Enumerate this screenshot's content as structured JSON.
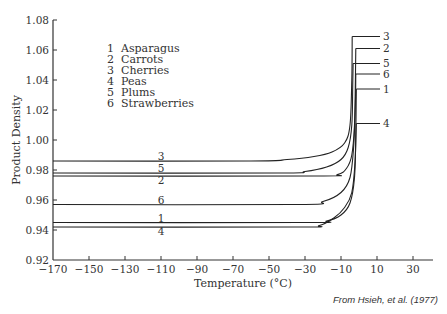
{
  "chart_data": {
    "type": "line",
    "title": "",
    "xlabel": "Temperature (°C)",
    "ylabel": "Product Density",
    "xlim": [
      -170,
      40
    ],
    "ylim": [
      0.92,
      1.08
    ],
    "x_ticks": [
      -170,
      -150,
      -130,
      -110,
      -90,
      -70,
      -50,
      -30,
      -10,
      10,
      30
    ],
    "y_ticks": [
      "0.92",
      "0.94",
      "0.96",
      "0.98",
      "1.00",
      "1.02",
      "1.04",
      "1.06",
      "1.08"
    ],
    "grid": false,
    "legend": {
      "position": "upper-left-inside",
      "entries": [
        {
          "num": "1",
          "label": "Asparagus"
        },
        {
          "num": "2",
          "label": "Carrots"
        },
        {
          "num": "3",
          "label": "Cherries"
        },
        {
          "num": "4",
          "label": "Peas"
        },
        {
          "num": "5",
          "label": "Plums"
        },
        {
          "num": "6",
          "label": "Strawberries"
        }
      ]
    },
    "series": [
      {
        "name": "Cherries",
        "num": "3",
        "x": [
          -170,
          -60,
          -40,
          -25,
          -15,
          -8,
          -5,
          -4,
          -3.8
        ],
        "y": [
          0.986,
          0.986,
          0.987,
          0.989,
          0.992,
          0.998,
          1.01,
          1.04,
          1.069
        ]
      },
      {
        "name": "Plums",
        "num": "5",
        "x": [
          -170,
          -45,
          -30,
          -18,
          -10,
          -6,
          -4,
          -3.5,
          -3.3
        ],
        "y": [
          0.978,
          0.978,
          0.979,
          0.982,
          0.987,
          0.995,
          1.01,
          1.035,
          1.051
        ]
      },
      {
        "name": "Carrots",
        "num": "2",
        "x": [
          -170,
          -25,
          -12,
          -7,
          -4,
          -2.5,
          -2,
          -1.8
        ],
        "y": [
          0.976,
          0.976,
          0.977,
          0.981,
          0.99,
          1.01,
          1.04,
          1.061
        ]
      },
      {
        "name": "Strawberries",
        "num": "6",
        "x": [
          -170,
          -35,
          -20,
          -10,
          -5,
          -3,
          -2,
          -1.8
        ],
        "y": [
          0.957,
          0.957,
          0.959,
          0.965,
          0.975,
          0.995,
          1.025,
          1.044
        ]
      },
      {
        "name": "Asparagus",
        "num": "1",
        "x": [
          -170,
          -30,
          -18,
          -10,
          -5,
          -2.5,
          -1.8,
          -1.5
        ],
        "y": [
          0.945,
          0.945,
          0.946,
          0.95,
          0.958,
          0.975,
          1.005,
          1.034
        ]
      },
      {
        "name": "Peas",
        "num": "4",
        "x": [
          -170,
          -35,
          -22,
          -14,
          -8,
          -4,
          -2.2,
          -1.5
        ],
        "y": [
          0.942,
          0.942,
          0.943,
          0.948,
          0.955,
          0.965,
          0.985,
          1.011
        ]
      }
    ],
    "curve_labels_left": [
      {
        "num": "3",
        "x": -110,
        "y": 0.989
      },
      {
        "num": "5",
        "x": -110,
        "y": 0.981
      },
      {
        "num": "2",
        "x": -110,
        "y": 0.973
      },
      {
        "num": "6",
        "x": -110,
        "y": 0.96
      },
      {
        "num": "1",
        "x": -110,
        "y": 0.948
      },
      {
        "num": "4",
        "x": -110,
        "y": 0.939
      }
    ],
    "annotations": [
      "From Hsieh, et al. (1977)"
    ]
  },
  "legend_lines": [
    "1  Asparagus",
    "2  Carrots",
    "3  Cherries",
    "4  Peas",
    "5  Plums",
    "6  Strawberries"
  ],
  "axis": {
    "xlabel": "Temperature (°C)",
    "ylabel": "Product Density"
  },
  "source": "From Hsieh, et al. (1977)"
}
